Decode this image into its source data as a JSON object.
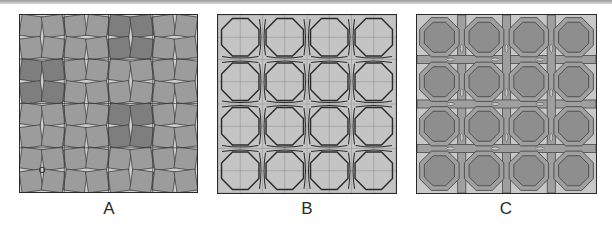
{
  "figure": {
    "panels": [
      {
        "id": "A",
        "label": "A",
        "description": "Grid of tilted squares (4x4 cells) with darker clusters",
        "colors": {
          "background": "#a7a7a7",
          "tile": "#9c9c9c",
          "dark_tile": "#7e7e7e",
          "gap": "#cfcfcf",
          "line": "#3a3a3a"
        },
        "dark_clusters": [
          [
            2,
            0
          ],
          [
            0,
            1
          ],
          [
            2,
            2
          ]
        ],
        "marker": {
          "shape": "circle",
          "cell": [
            0,
            3
          ]
        }
      },
      {
        "id": "B",
        "label": "B",
        "description": "Outlined octagon lattice (4x4) with interlaced strap lines",
        "colors": {
          "background": "#c4c4c4",
          "outline": "#2a2a2a",
          "guide": "#8c8c8c"
        }
      },
      {
        "id": "C",
        "label": "C",
        "description": "Filled octagon lattice (4x4) with banded interlace",
        "colors": {
          "background": "#c8c8c8",
          "octagon": "#8e8e8e",
          "band": "#9f9f9f",
          "outline": "#4a4a4a"
        }
      }
    ]
  }
}
